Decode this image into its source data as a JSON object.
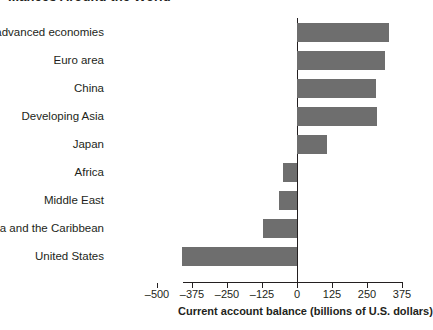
{
  "chart_data": {
    "type": "bar",
    "orientation": "horizontal",
    "title": "...ances Around the World",
    "xlabel": "Current account balance (billions of U.S. dollars)",
    "ylabel": "",
    "categories": [
      "Other advanced economies",
      "Euro area",
      "China",
      "Developing Asia",
      "Japan",
      "Africa",
      "Middle East",
      "Latin America and the Caribbean",
      "United States"
    ],
    "values": [
      330,
      315,
      283,
      287,
      107,
      -50,
      -65,
      -120,
      -410
    ],
    "xlim": [
      -510,
      410
    ],
    "xticks": [
      -500,
      -375,
      -250,
      -125,
      0,
      125,
      250,
      375
    ],
    "xtick_labels": [
      "–500",
      "–375",
      "–250",
      "–125",
      "0",
      "125",
      "250",
      "375"
    ],
    "grid": false,
    "legend": false,
    "bar_color": "#6e6e6e",
    "axis_color": "#231f20"
  }
}
